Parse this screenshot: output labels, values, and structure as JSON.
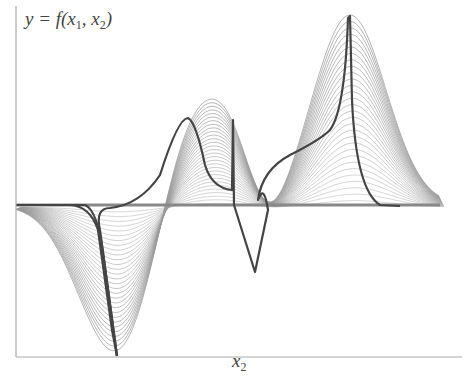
{
  "chart_data": {
    "type": "line",
    "title": "",
    "ylabel": "y = f(x1, x2)",
    "xlabel": "x2",
    "grid": false,
    "legend": "none",
    "x_range": [
      0,
      1
    ],
    "y_range": [
      -1,
      1
    ],
    "features": [
      {
        "name": "left-trough",
        "x": 0.23,
        "y": -1.0
      },
      {
        "name": "center-left-peak",
        "x": 0.38,
        "y": 0.58
      },
      {
        "name": "center-bump",
        "x": 0.49,
        "y": 0.55
      },
      {
        "name": "center-trough",
        "x": 0.53,
        "y": -0.44
      },
      {
        "name": "right-peak",
        "x": 0.75,
        "y": 1.0
      }
    ],
    "series": [
      {
        "name": "gray-slices",
        "color": "#9a9a9a",
        "count": 30
      },
      {
        "name": "dark-slice-1",
        "color": "#444444"
      },
      {
        "name": "dark-slice-2",
        "color": "#444444"
      }
    ]
  },
  "labels": {
    "y_prefix": "y = f(x",
    "y_sub1": "1",
    "y_mid": ", x",
    "y_sub2": "2",
    "y_suffix": ")",
    "x_main": "x",
    "x_sub": "2"
  },
  "colors": {
    "axis": "#aaaaaa",
    "slice": "#9a9a9a",
    "highlight": "#444444"
  }
}
